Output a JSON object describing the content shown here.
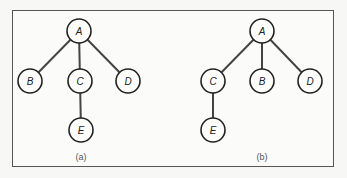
{
  "figure": {
    "panels": [
      {
        "id": "a",
        "caption": "(a)",
        "caption_pos": {
          "x": 81,
          "y": 158
        },
        "nodes": [
          {
            "label": "A",
            "x": 79,
            "y": 31
          },
          {
            "label": "B",
            "x": 30,
            "y": 81
          },
          {
            "label": "C",
            "x": 80,
            "y": 81
          },
          {
            "label": "D",
            "x": 128,
            "y": 81
          },
          {
            "label": "E",
            "x": 81,
            "y": 130
          }
        ],
        "edges": [
          [
            "A",
            "B"
          ],
          [
            "A",
            "C"
          ],
          [
            "A",
            "D"
          ],
          [
            "C",
            "E"
          ]
        ]
      },
      {
        "id": "b",
        "caption": "(b)",
        "caption_pos": {
          "x": 262,
          "y": 158
        },
        "nodes": [
          {
            "label": "A",
            "x": 262,
            "y": 31
          },
          {
            "label": "C",
            "x": 213,
            "y": 81
          },
          {
            "label": "B",
            "x": 262,
            "y": 81
          },
          {
            "label": "D",
            "x": 310,
            "y": 81
          },
          {
            "label": "E",
            "x": 213,
            "y": 130
          }
        ],
        "edges": [
          [
            "A",
            "C"
          ],
          [
            "A",
            "B"
          ],
          [
            "A",
            "D"
          ],
          [
            "C",
            "E"
          ]
        ]
      }
    ],
    "node_radius": 12,
    "colors": {
      "stroke": "#222222",
      "edge": "#444444",
      "frame": "#555555",
      "background": "#f7f7f5"
    }
  }
}
